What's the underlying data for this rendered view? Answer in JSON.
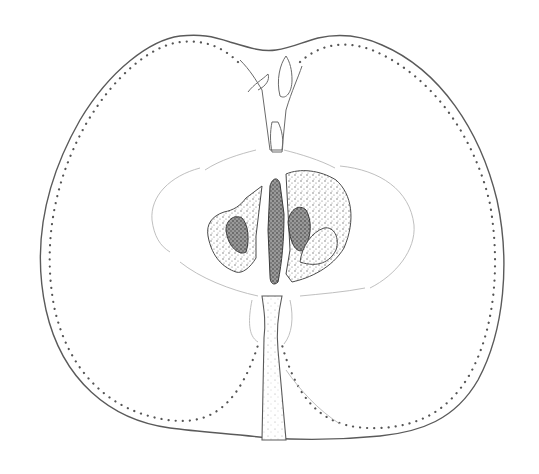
{
  "illustration": {
    "subject": "apple longitudinal cross-section",
    "style": "pen-and-ink stipple drawing",
    "colors": {
      "background": "#ffffff",
      "ink": "#555555",
      "faint_line": "#b8b8b8"
    },
    "parts": [
      "outer skin outline",
      "dotted vascular bundle line",
      "calyx (top)",
      "core line",
      "seed cavities",
      "seeds",
      "central axis",
      "stalk (bottom)"
    ]
  }
}
